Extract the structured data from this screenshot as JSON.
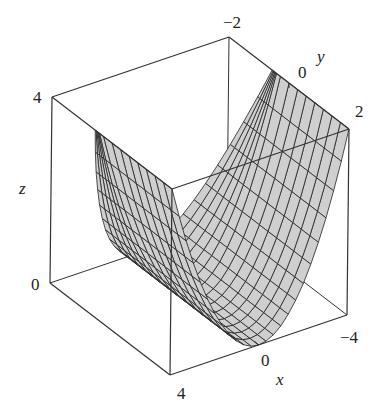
{
  "chart_data": {
    "type": "surface3d",
    "title": "",
    "xlabel": "x",
    "ylabel": "y",
    "zlabel": "z",
    "xlim": [
      -4,
      4
    ],
    "ylim": [
      -2,
      2
    ],
    "zlim": [
      0,
      4
    ],
    "x_ticks": [
      "4",
      "0",
      "-4"
    ],
    "y_ticks": [
      "-2",
      "0",
      "2"
    ],
    "z_ticks": [
      "0",
      "4"
    ],
    "surface_color": "#cfcfcf",
    "mesh_color": "#222222",
    "box_color": "#333333",
    "grid": false,
    "legend": "none",
    "mesh_u": 24,
    "mesh_v": 14
  },
  "labels": {
    "z_top": "4",
    "z_bottom": "0",
    "y_left": "−2",
    "y_mid": "0",
    "y_right": "2",
    "x_front": "4",
    "x_mid": "0",
    "x_right": "−4",
    "x_axis": "x",
    "y_axis": "y",
    "z_axis": "z"
  }
}
